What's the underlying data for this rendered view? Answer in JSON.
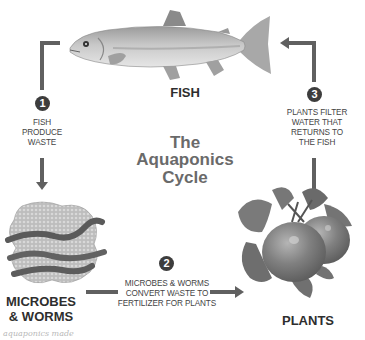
{
  "diagram": {
    "title": {
      "line1": "The",
      "line2": "Aquaponics",
      "line3": "Cycle"
    },
    "nodes": {
      "fish": {
        "label": "FISH"
      },
      "microbes": {
        "label_line1": "MICROBES",
        "label_line2": "& WORMS"
      },
      "plants": {
        "label": "PLANTS"
      }
    },
    "steps": [
      {
        "number": "1",
        "lines": [
          "FISH",
          "PRODUCE",
          "WASTE"
        ]
      },
      {
        "number": "2",
        "lines": [
          "MICROBES & WORMS",
          "CONVERT WASTE TO",
          "FERTILIZER FOR PLANTS"
        ]
      },
      {
        "number": "3",
        "lines": [
          "PLANTS FILTER",
          "WATER THAT",
          "RETURNS TO",
          "THE FISH"
        ]
      }
    ],
    "colors": {
      "arrow": "#606060",
      "badge": "#3d3d3d",
      "title": "#6a6a6a",
      "label": "#2e2e2e"
    },
    "watermark": "aquaponics made"
  }
}
